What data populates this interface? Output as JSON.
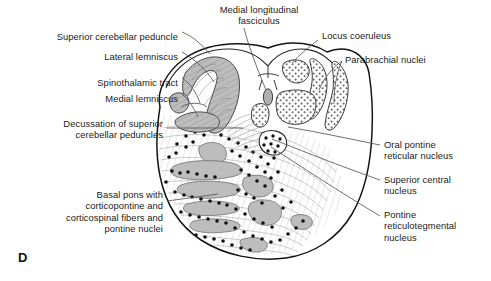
{
  "figure": {
    "panel_letter": "D",
    "background_color": "#ffffff",
    "outline_color": "#1a1a1a",
    "tract_fill_color": "#b8b8b8",
    "nucleus_stipple_color": "#555555",
    "neuron_dot_color": "#111111",
    "leader_line_color": "#555555",
    "text_color": "#1a1a1a"
  },
  "labels": {
    "left": [
      {
        "id": "superior-cerebellar-peduncle",
        "text": "Superior cerebellar peduncle",
        "x": 178,
        "y": 35,
        "align": "right"
      },
      {
        "id": "lateral-lemniscus",
        "text": "Lateral lemniscus",
        "x": 178,
        "y": 55,
        "align": "right"
      },
      {
        "id": "spinothalamic-tract",
        "text": "Spinothalamic tract",
        "x": 178,
        "y": 81,
        "align": "right"
      },
      {
        "id": "medial-lemniscus",
        "text": "Medial lemniscus",
        "x": 178,
        "y": 97,
        "align": "right"
      },
      {
        "id": "decussation-of-superior-cerebellar-peduncles",
        "text": "Decussation of superior\ncerebellar peduncles",
        "x": 163,
        "y": 122,
        "align": "right"
      },
      {
        "id": "basal-pons",
        "text": "Basal pons with\ncorticopontine and\ncorticospinal fibers and\npontine nuclei",
        "x": 163,
        "y": 193,
        "align": "right"
      }
    ],
    "top": [
      {
        "id": "medial-longitudinal-fasciculus",
        "text": "Medial longitudinal\nfasciculus",
        "x": 199,
        "y": 6,
        "align": "left"
      }
    ],
    "right": [
      {
        "id": "locus-coeruleus",
        "text": "Locus coeruleus",
        "x": 322,
        "y": 32,
        "align": "left"
      },
      {
        "id": "parabrachial-nuclei",
        "text": "Parabrachial nuclei",
        "x": 345,
        "y": 56,
        "align": "left"
      },
      {
        "id": "oral-pontine-reticular-nucleus",
        "text": "Oral pontine\nreticular nucleus",
        "x": 384,
        "y": 143,
        "align": "left"
      },
      {
        "id": "superior-central-nucleus",
        "text": "Superior central\nnucleus",
        "x": 384,
        "y": 178,
        "align": "left"
      },
      {
        "id": "pontine-reticulotegmental-nucleus",
        "text": "Pontine\nreticulotegmental\nnucleus",
        "x": 384,
        "y": 213,
        "align": "left"
      }
    ]
  },
  "structures": [
    {
      "id": "superior-cerebellar-peduncle",
      "kind": "fiber-tract",
      "shading": "hatched-gray"
    },
    {
      "id": "lateral-lemniscus",
      "kind": "fiber-tract",
      "shading": "hatched-gray"
    },
    {
      "id": "spinothalamic-tract",
      "kind": "fiber-tract",
      "shading": "hatched-gray"
    },
    {
      "id": "medial-lemniscus",
      "kind": "fiber-tract",
      "shading": "hatched-gray"
    },
    {
      "id": "medial-longitudinal-fasciculus",
      "kind": "fiber-tract",
      "shading": "solid-gray"
    },
    {
      "id": "locus-coeruleus",
      "kind": "nucleus",
      "shading": "stippled"
    },
    {
      "id": "parabrachial-nuclei",
      "kind": "nucleus",
      "shading": "stippled"
    },
    {
      "id": "oral-pontine-reticular-nucleus",
      "kind": "nucleus",
      "shading": "open"
    },
    {
      "id": "superior-central-nucleus",
      "kind": "nucleus",
      "shading": "stippled"
    },
    {
      "id": "pontine-reticulotegmental-nucleus",
      "kind": "nucleus",
      "shading": "coarse-dots"
    },
    {
      "id": "basal-pons",
      "kind": "region",
      "shading": "gray-blobs-and-dots"
    },
    {
      "id": "decussation-of-superior-cerebellar-peduncles",
      "kind": "fiber-decussation",
      "shading": "fine-lines"
    }
  ]
}
